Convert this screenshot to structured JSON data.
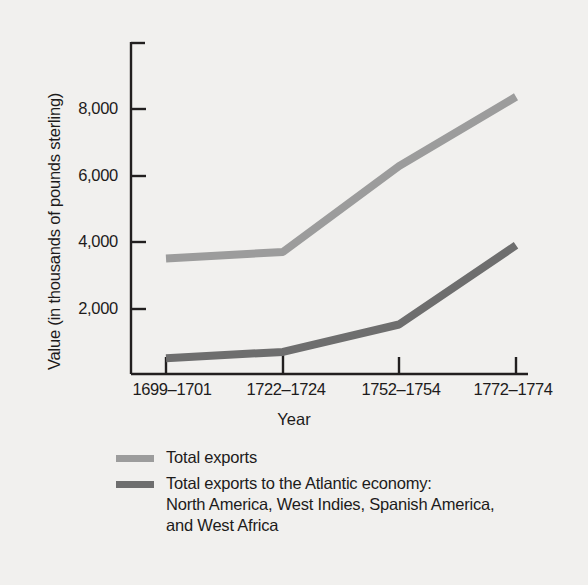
{
  "chart_data": {
    "type": "line",
    "title": "",
    "xlabel": "Year",
    "ylabel": "Value (in thousands of pounds sterling)",
    "categories": [
      "1699–1701",
      "1722–1724",
      "1752–1754",
      "1772–1774"
    ],
    "yticks": [
      2000,
      4000,
      6000,
      8000
    ],
    "ytick_labels": [
      "2,000",
      "4,000",
      "6,000",
      "8,000"
    ],
    "ylim": [
      0,
      9600
    ],
    "grid": false,
    "legend_position": "below",
    "series": [
      {
        "name": "Total exports",
        "legend_label": "Total exports",
        "color": "#9c9c9c",
        "values": [
          3500,
          3700,
          6300,
          8400
        ]
      },
      {
        "name": "Total exports to the Atlantic economy",
        "legend_label": "Total exports to the Atlantic economy:\nNorth America, West Indies, Spanish America,\nand West Africa",
        "color": "#6e6e6e",
        "values": [
          480,
          670,
          1500,
          3900
        ]
      }
    ]
  },
  "colors": {
    "background": "#f1f0ee",
    "axis": "#221f1f",
    "text": "#1d1b1b",
    "series_total_exports": "#9c9c9c",
    "series_atlantic": "#6e6e6e"
  }
}
